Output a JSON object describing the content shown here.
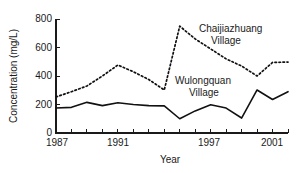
{
  "chart_data": {
    "type": "line",
    "title": "",
    "xlabel": "Year",
    "ylabel": "Concentration (mg/L)",
    "xlim": [
      1987,
      2002
    ],
    "ylim": [
      0,
      800
    ],
    "yticks": [
      0,
      200,
      400,
      600,
      800
    ],
    "ytick_labels": [
      "0",
      "200",
      "400",
      "600",
      "800"
    ],
    "xticks": [
      1987,
      1988,
      1989,
      1990,
      1991,
      1992,
      1993,
      1994,
      1995,
      1996,
      1997,
      1998,
      1999,
      2000,
      2001,
      2002
    ],
    "xtick_labels_shown": [
      "1987",
      "1991",
      "1997",
      "2001"
    ],
    "xtick_labels_shown_at": [
      1987,
      1991,
      1997,
      2001
    ],
    "grid": false,
    "legend_position": "inline-annotation",
    "x": [
      1987,
      1988,
      1989,
      1990,
      1991,
      1992,
      1993,
      1994,
      1995,
      1996,
      1997,
      1998,
      1999,
      2000,
      2001,
      2002
    ],
    "series": [
      {
        "name": "Chaijiazhuang Village",
        "style": "dotted",
        "color": "#111111",
        "values": [
          253,
          290,
          330,
          400,
          477,
          430,
          375,
          302,
          750,
          660,
          590,
          520,
          470,
          400,
          495,
          498
        ]
      },
      {
        "name": "Wulongquan Village",
        "style": "solid",
        "color": "#111111",
        "values": [
          175,
          180,
          215,
          192,
          212,
          200,
          192,
          190,
          100,
          155,
          198,
          175,
          105,
          302,
          235,
          290
        ]
      }
    ],
    "annotations": [
      {
        "text": "Chaijiazhuang",
        "series": "Chaijiazhuang Village",
        "line": 1
      },
      {
        "text": "Village",
        "series": "Chaijiazhuang Village",
        "line": 2
      },
      {
        "text": "Wulongquan",
        "series": "Wulongquan Village",
        "line": 1
      },
      {
        "text": "Village",
        "series": "Wulongquan Village",
        "line": 2
      }
    ]
  },
  "labels": {
    "y_axis_title": "Concentration (mg/L)",
    "x_axis_title": "Year",
    "y_800": "800",
    "y_600": "600",
    "y_400": "400",
    "y_200": "200",
    "y_0": "0",
    "x_1987": "1987",
    "x_1991": "1991",
    "x_1997": "1997",
    "x_2001": "2001",
    "series1_line1": "Chaijiazhuang",
    "series1_line2": "Village",
    "series2_line1": "Wulongquan",
    "series2_line2": "Village"
  },
  "colors": {
    "background": "#ffffff",
    "ink": "#111111",
    "axis": "#1a1a1a"
  }
}
